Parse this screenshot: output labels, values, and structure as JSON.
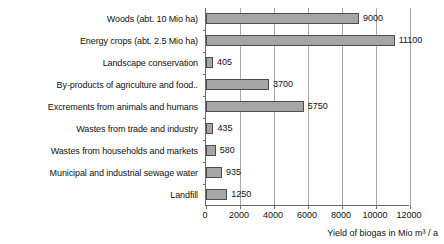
{
  "chart_data": {
    "type": "bar",
    "orientation": "horizontal",
    "title": "",
    "xlabel": "Yield of biogas in Mio m³ / a",
    "ylabel": "",
    "xlim": [
      0,
      12000
    ],
    "xticks": [
      0,
      2000,
      4000,
      6000,
      8000,
      10000,
      12000
    ],
    "xtick_labels": [
      "0",
      "2000",
      "4000",
      "6000",
      "8000",
      "10000",
      "12000"
    ],
    "grid": true,
    "legend": false,
    "categories": [
      "Woods (abt. 10 Mio ha)",
      "Energy crops (abt. 2.5 Mio ha)",
      "Landscape conservation",
      "By-products of agriculture and food..",
      "Excrements from animals and humans",
      "Wastes from trade and industry",
      "Wastes from households and markets",
      "Municipal and industrial sewage water",
      "Landfill"
    ],
    "values": [
      9000,
      11100,
      405,
      3700,
      5750,
      435,
      580,
      935,
      1250
    ],
    "data_labels": [
      "9000",
      "11100",
      "405",
      "3700",
      "5750",
      "435",
      "580",
      "935",
      "1250"
    ],
    "bar_color": "#a6a6a6",
    "bar_border_color": "#4d4d4d",
    "axis_color": "#6b6b6b",
    "gridline_color": "#a9a9a9",
    "background": "#ffffff"
  }
}
